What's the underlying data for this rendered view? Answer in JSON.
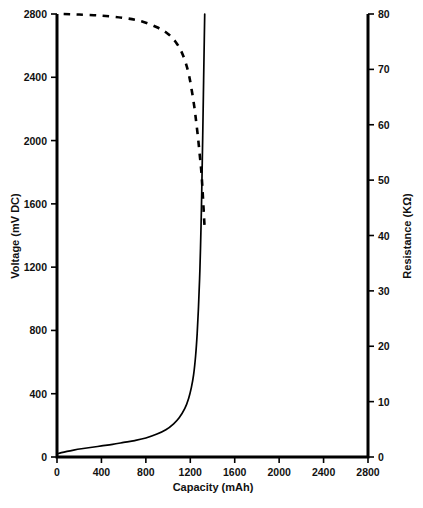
{
  "chart_data": {
    "type": "line",
    "title": "",
    "xlabel": "Capacity (mAh)",
    "ylabel": "Voltage (mV DC)",
    "y2label": "Resistance (KΩ)",
    "xlim": [
      0,
      2800
    ],
    "ylim": [
      0,
      2800
    ],
    "y2lim": [
      0,
      80
    ],
    "xticks": [
      0,
      400,
      800,
      1200,
      1600,
      2000,
      2400,
      2800
    ],
    "xticklabels": [
      "0",
      "400",
      "800",
      "1200",
      "1600",
      "2000",
      "2400",
      "2800"
    ],
    "yticks": [
      0,
      400,
      800,
      1200,
      1600,
      2000,
      2400,
      2800
    ],
    "yticklabels": [
      "0",
      "400",
      "800",
      "1200",
      "1600",
      "2000",
      "2400",
      "2800"
    ],
    "y2ticks": [
      0,
      10,
      20,
      30,
      40,
      50,
      60,
      70,
      80
    ],
    "y2ticklabels": [
      "0",
      "10",
      "20",
      "30",
      "40",
      "50",
      "60",
      "70",
      "80"
    ],
    "grid": false,
    "legend": "none",
    "series": [
      {
        "name": "Voltage",
        "style": "solid",
        "axis": "left",
        "color": "#000000",
        "x": [
          0,
          40,
          90,
          150,
          220,
          300,
          400,
          500,
          600,
          700,
          800,
          900,
          980,
          1050,
          1100,
          1150,
          1185,
          1210,
          1230,
          1248,
          1262,
          1274,
          1284,
          1292,
          1300,
          1306,
          1312,
          1318,
          1324,
          1330
        ],
        "y": [
          20,
          28,
          36,
          44,
          52,
          60,
          70,
          80,
          92,
          104,
          120,
          145,
          172,
          210,
          248,
          305,
          370,
          440,
          520,
          640,
          780,
          950,
          1130,
          1320,
          1560,
          1790,
          2030,
          2290,
          2550,
          2800
        ]
      },
      {
        "name": "Resistance",
        "style": "dashed",
        "axis": "right",
        "color": "#000000",
        "x": [
          60,
          200,
          400,
          600,
          760,
          900,
          1000,
          1070,
          1120,
          1160,
          1190,
          1215,
          1238,
          1255,
          1270,
          1282,
          1292,
          1300,
          1308,
          1316,
          1324,
          1330
        ],
        "y": [
          80.0,
          79.9,
          79.7,
          79.3,
          78.7,
          77.6,
          76.4,
          74.9,
          73.2,
          71.1,
          68.8,
          66.0,
          63.0,
          60.2,
          57.6,
          55.2,
          53.2,
          51.4,
          49.0,
          46.2,
          43.2,
          41.2
        ]
      }
    ]
  },
  "geometry": {
    "plot_left": 57,
    "plot_right": 368,
    "plot_top": 14,
    "plot_bottom": 457
  }
}
